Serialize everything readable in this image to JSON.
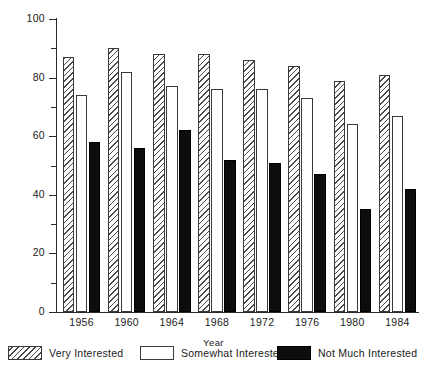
{
  "chart_data": {
    "type": "bar",
    "title": "",
    "subtitle": "",
    "xlabel": "Year",
    "ylabel": "% Voting",
    "categories": [
      "1956",
      "1960",
      "1964",
      "1968",
      "1972",
      "1976",
      "1980",
      "1984"
    ],
    "series": [
      {
        "name": "Very Interested",
        "style": "diagonal-hatch",
        "values": [
          87,
          90,
          88,
          88,
          86,
          84,
          79,
          81
        ]
      },
      {
        "name": "Somewhat Interested",
        "style": "white-outline",
        "values": [
          74,
          82,
          77,
          76,
          76,
          73,
          64,
          67
        ]
      },
      {
        "name": "Not Much Interested",
        "style": "solid-black",
        "values": [
          58,
          56,
          62,
          52,
          51,
          47,
          35,
          42
        ]
      }
    ],
    "ylim": [
      0,
      100
    ],
    "yticks_major": [
      0,
      20,
      40,
      60,
      80,
      100
    ],
    "yticks_minor": [
      10,
      30,
      50,
      70,
      90
    ],
    "ytick_labels": [
      "0",
      "20",
      "40",
      "60",
      "80",
      "100"
    ],
    "grid": false,
    "legend_position": "bottom"
  },
  "axes": {
    "y_title": "% Voting",
    "x_title": "Year"
  },
  "legend": {
    "items": [
      {
        "label": "Very Interested",
        "swatch": "hatched-swatch"
      },
      {
        "label": "Somewhat Interested",
        "swatch": "white-swatch"
      },
      {
        "label": "Not Much Interested",
        "swatch": "black-swatch"
      }
    ]
  },
  "colors": {
    "axis": "#2b2b2b",
    "hatch": "#4a4a4a",
    "black_bar": "#0d0d0d",
    "background": "#ffffff"
  }
}
